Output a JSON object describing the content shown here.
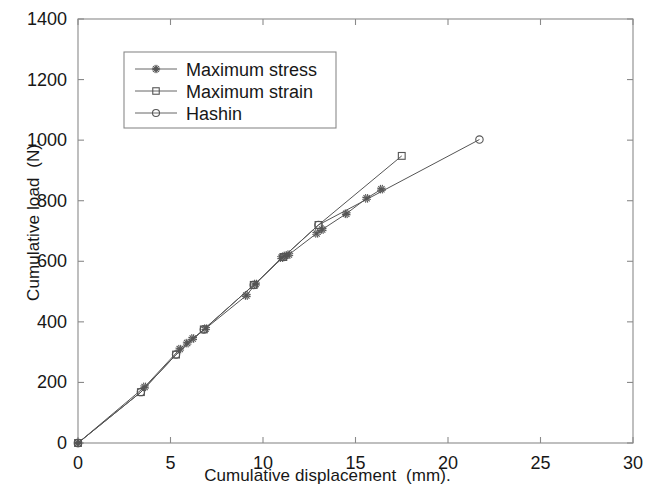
{
  "chart_data": {
    "type": "line",
    "title": "",
    "xlabel": "Cumulative displacement  (mm).",
    "ylabel": "Cumulative load  (N).",
    "xlim": [
      0,
      30
    ],
    "ylim": [
      0,
      1400
    ],
    "xticks": [
      0,
      5,
      10,
      15,
      20,
      25,
      30
    ],
    "yticks": [
      0,
      200,
      400,
      600,
      800,
      1000,
      1200,
      1400
    ],
    "xtick_labels": [
      "0",
      "5",
      "10",
      "15",
      "20",
      "25",
      "30"
    ],
    "ytick_labels": [
      "0",
      "200",
      "400",
      "600",
      "800",
      "1000",
      "1200",
      "1400"
    ],
    "grid": false,
    "legend_position": "upper left",
    "series": [
      {
        "name": "Maximum stress",
        "marker": "star",
        "color": "#555555",
        "points": [
          [
            0.0,
            0
          ],
          [
            3.6,
            185
          ],
          [
            5.5,
            310
          ],
          [
            5.9,
            330
          ],
          [
            6.2,
            345
          ],
          [
            6.9,
            378
          ],
          [
            9.1,
            487
          ],
          [
            9.6,
            525
          ],
          [
            11.0,
            612
          ],
          [
            11.2,
            618
          ],
          [
            11.4,
            622
          ],
          [
            12.9,
            692
          ],
          [
            13.2,
            705
          ],
          [
            14.5,
            757
          ],
          [
            15.6,
            808
          ],
          [
            16.4,
            838
          ]
        ]
      },
      {
        "name": "Maximum strain",
        "marker": "square",
        "color": "#555555",
        "points": [
          [
            0.0,
            0
          ],
          [
            3.4,
            168
          ],
          [
            5.3,
            292
          ],
          [
            6.8,
            375
          ],
          [
            9.5,
            522
          ],
          [
            11.1,
            614
          ],
          [
            13.0,
            720
          ],
          [
            17.5,
            948
          ]
        ]
      },
      {
        "name": "Hashin",
        "marker": "circle",
        "color": "#555555",
        "points": [
          [
            0.0,
            0
          ],
          [
            3.4,
            168
          ],
          [
            5.3,
            292
          ],
          [
            6.8,
            375
          ],
          [
            9.5,
            522
          ],
          [
            11.1,
            614
          ],
          [
            13.0,
            720
          ],
          [
            21.7,
            1002
          ]
        ]
      }
    ]
  },
  "legend": {
    "entries": [
      {
        "label": "Maximum stress",
        "marker": "star"
      },
      {
        "label": "Maximum strain",
        "marker": "square"
      },
      {
        "label": "Hashin",
        "marker": "circle"
      }
    ]
  }
}
